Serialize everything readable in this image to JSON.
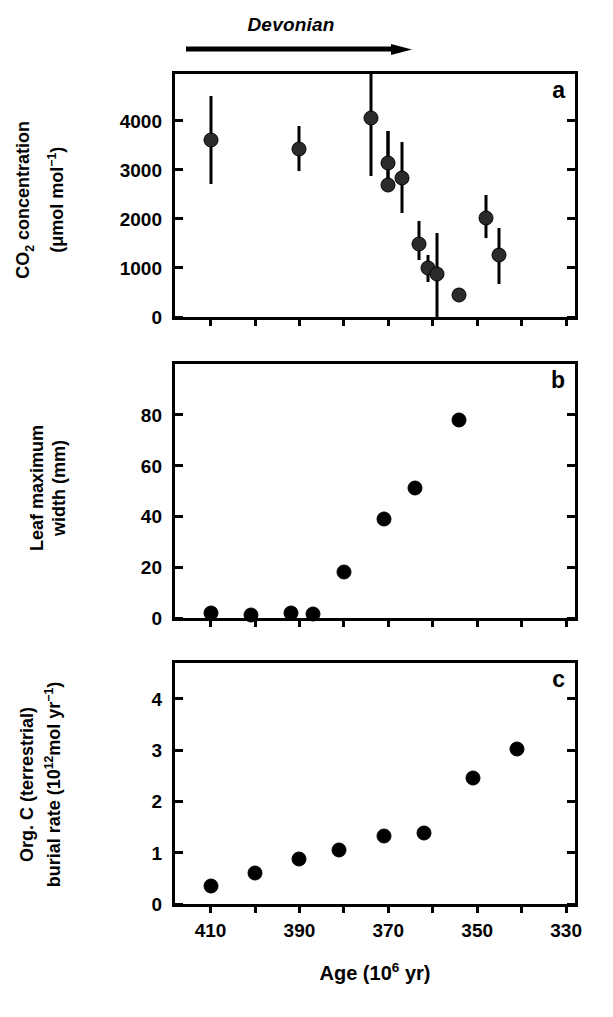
{
  "figure": {
    "era_label": "Devonian",
    "panel_letters": {
      "a": "a",
      "b": "b",
      "c": "c"
    },
    "x_axis": {
      "title_main": "Age (10",
      "title_sup": "6",
      "title_tail": " yr)",
      "title_full": "Age (10^6 yr)",
      "ticks": [
        410,
        390,
        370,
        350,
        330
      ],
      "tick_labels": [
        "410",
        "390",
        "370",
        "350",
        "330"
      ],
      "range": [
        418,
        328
      ],
      "minor_step": 10
    }
  },
  "chart_data": [
    {
      "type": "scatter",
      "panel": "a",
      "title": "",
      "xlabel": "Age (10^6 yr)",
      "ylabel": "CO2 concentration (μmol mol-1)",
      "ylabel_line1_pre": "CO",
      "ylabel_line1_sub": "2",
      "ylabel_line1_post": " concentration",
      "ylabel_line2_pre": "(μmol mol",
      "ylabel_line2_sup": "−1",
      "ylabel_line2_post": ")",
      "xlim": [
        418,
        328
      ],
      "ylim": [
        0,
        4950
      ],
      "yticks": [
        0,
        1000,
        2000,
        3000,
        4000
      ],
      "ytick_labels": [
        "0",
        "1000",
        "2000",
        "3000",
        "4000"
      ],
      "grid": false,
      "legend": "none",
      "errorbars": true,
      "points": [
        {
          "x": 410,
          "y": 3600,
          "yerr_low": 2700,
          "yerr_high": 4500
        },
        {
          "x": 390,
          "y": 3430,
          "yerr_low": 2980,
          "yerr_high": 3890
        },
        {
          "x": 374,
          "y": 4050,
          "yerr_low": 2870,
          "yerr_high": 4950
        },
        {
          "x": 370,
          "y": 3130,
          "yerr_low": 2630,
          "yerr_high": 3790
        },
        {
          "x": 370,
          "y": 2680,
          "yerr_low": 2630,
          "yerr_high": 3790
        },
        {
          "x": 367,
          "y": 2830,
          "yerr_low": 2120,
          "yerr_high": 3560
        },
        {
          "x": 363,
          "y": 1490,
          "yerr_low": 1160,
          "yerr_high": 1950
        },
        {
          "x": 361,
          "y": 990,
          "yerr_low": 720,
          "yerr_high": 1260
        },
        {
          "x": 359,
          "y": 870,
          "yerr_low": 0,
          "yerr_high": 1710
        },
        {
          "x": 354,
          "y": 450,
          "yerr_low": 450,
          "yerr_high": 450
        },
        {
          "x": 348,
          "y": 2010,
          "yerr_low": 1610,
          "yerr_high": 2480
        },
        {
          "x": 345,
          "y": 1260,
          "yerr_low": 680,
          "yerr_high": 1810
        }
      ]
    },
    {
      "type": "scatter",
      "panel": "b",
      "title": "",
      "xlabel": "Age (10^6 yr)",
      "ylabel": "Leaf maximum width (mm)",
      "ylabel_line1": "Leaf maximum",
      "ylabel_line2": "width (mm)",
      "xlim": [
        418,
        328
      ],
      "ylim": [
        0,
        100
      ],
      "yticks": [
        0,
        20,
        40,
        60,
        80
      ],
      "ytick_labels": [
        "0",
        "20",
        "40",
        "60",
        "80"
      ],
      "grid": false,
      "legend": "none",
      "errorbars": false,
      "points": [
        {
          "x": 410,
          "y": 2
        },
        {
          "x": 401,
          "y": 1
        },
        {
          "x": 392,
          "y": 2
        },
        {
          "x": 387,
          "y": 1.5
        },
        {
          "x": 380,
          "y": 18
        },
        {
          "x": 371,
          "y": 39
        },
        {
          "x": 364,
          "y": 51
        },
        {
          "x": 354,
          "y": 78
        }
      ]
    },
    {
      "type": "scatter",
      "panel": "c",
      "title": "",
      "xlabel": "Age (10^6 yr)",
      "ylabel": "Org. C (terrestrial) burial rate (10^12 mol yr-1)",
      "ylabel_line1_pre": "Org. C (terrestrial)",
      "ylabel_line2_pre": "burial rate (10",
      "ylabel_line2_sup": "12",
      "ylabel_line2_mid": "mol yr",
      "ylabel_line2_sup2": "−1",
      "ylabel_line2_post": ")",
      "xlim": [
        418,
        328
      ],
      "ylim": [
        0,
        4.7
      ],
      "yticks": [
        0,
        1,
        2,
        3,
        4
      ],
      "ytick_labels": [
        "0",
        "1",
        "2",
        "3",
        "4"
      ],
      "grid": false,
      "legend": "none",
      "errorbars": false,
      "points": [
        {
          "x": 410,
          "y": 0.35
        },
        {
          "x": 400,
          "y": 0.6
        },
        {
          "x": 390,
          "y": 0.88
        },
        {
          "x": 381,
          "y": 1.05
        },
        {
          "x": 371,
          "y": 1.32
        },
        {
          "x": 362,
          "y": 1.38
        },
        {
          "x": 351,
          "y": 2.45
        },
        {
          "x": 341,
          "y": 3.02
        }
      ]
    }
  ]
}
